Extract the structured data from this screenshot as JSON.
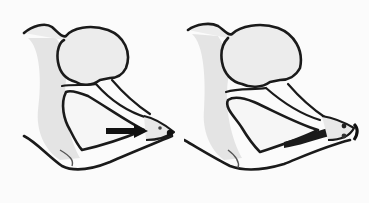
{
  "figure": {
    "panel_count": 2,
    "background": "#fbfbfb",
    "line_color": "#1a1a1a",
    "fill_color": "#efefef",
    "shade_color": "#dcdcdc",
    "panels": [
      {
        "id": "left",
        "arrow": "black-arrow-pointing-to-tip"
      },
      {
        "id": "right",
        "arrow": "none",
        "dark_band": "lower-edge-shading"
      }
    ]
  }
}
